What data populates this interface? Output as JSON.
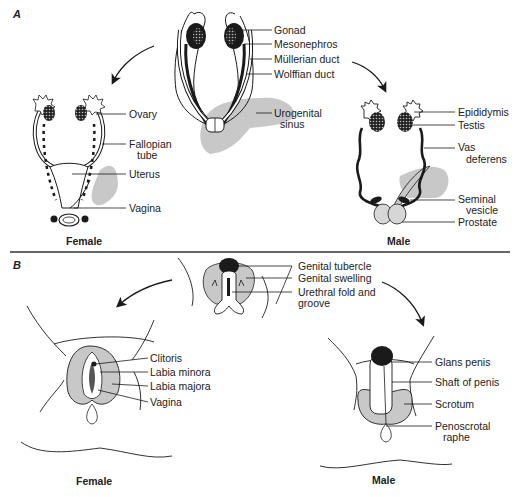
{
  "figure": {
    "panel_a": {
      "letter": "A",
      "center_labels": [
        "Gonad",
        "Mesonephros",
        "Müllerian duct",
        "Wolffian duct",
        "Urogenital",
        "sinus"
      ],
      "female_labels": [
        "Ovary",
        "Fallopian",
        "tube",
        "Uterus",
        "Vagina"
      ],
      "male_labels": [
        "Epididymis",
        "Testis",
        "Vas",
        "deferens",
        "Seminal",
        "vesicle",
        "Prostate"
      ],
      "female_caption": "Female",
      "male_caption": "Male"
    },
    "panel_b": {
      "letter": "B",
      "center_labels": [
        "Genital tubercle",
        "Genital swelling",
        "Urethral fold and",
        "groove"
      ],
      "female_labels": [
        "Clitoris",
        "Labia minora",
        "Labia majora",
        "Vagina"
      ],
      "male_labels": [
        "Glans penis",
        "Shaft of penis",
        "Scrotum",
        "Penoscrotal",
        "raphe"
      ],
      "female_caption": "Female",
      "male_caption": "Male"
    },
    "colors": {
      "line": "#1a1a1a",
      "shade": "#c8c8c8",
      "divider": "#333333"
    }
  }
}
